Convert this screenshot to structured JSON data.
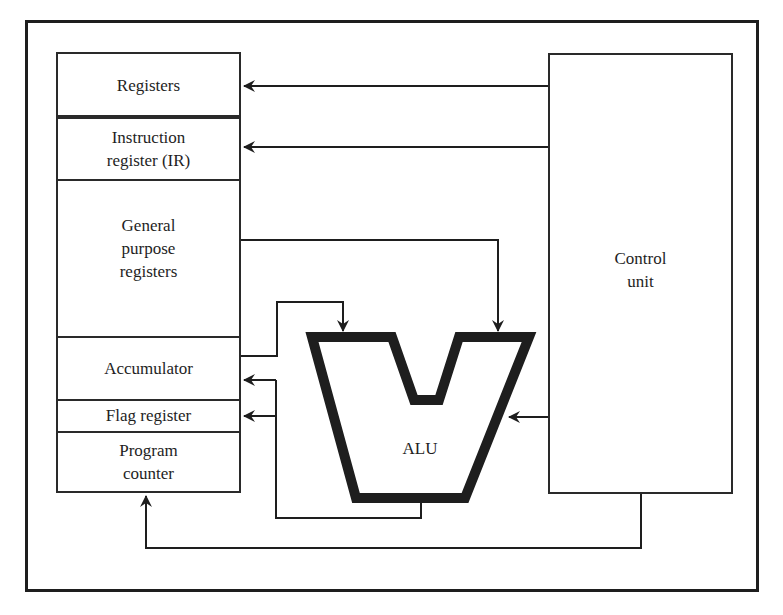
{
  "diagram": {
    "type": "cpu-block-diagram",
    "register_stack": {
      "cells": [
        {
          "id": "registers",
          "label": "Registers"
        },
        {
          "id": "instruction-register",
          "label": "Instruction\nregister (IR)"
        },
        {
          "id": "general-purpose-registers",
          "label": "General\npurpose\nregisters"
        },
        {
          "id": "accumulator",
          "label": "Accumulator"
        },
        {
          "id": "flag-register",
          "label": "Flag register"
        },
        {
          "id": "program-counter",
          "label": "Program\ncounter"
        }
      ]
    },
    "control_unit": {
      "label": "Control\nunit"
    },
    "alu": {
      "label": "ALU"
    },
    "connections": [
      {
        "from": "control-unit",
        "to": "registers"
      },
      {
        "from": "control-unit",
        "to": "instruction-register"
      },
      {
        "from": "general-purpose-registers",
        "to": "alu-right-input"
      },
      {
        "from": "accumulator",
        "to": "alu-left-input"
      },
      {
        "from": "control-unit",
        "to": "alu"
      },
      {
        "from": "alu-output",
        "to": "accumulator"
      },
      {
        "from": "alu-output",
        "to": "flag-register"
      },
      {
        "from": "control-unit",
        "to": "program-counter"
      }
    ]
  },
  "colors": {
    "line": "#1e1e1e",
    "background": "#ffffff"
  }
}
